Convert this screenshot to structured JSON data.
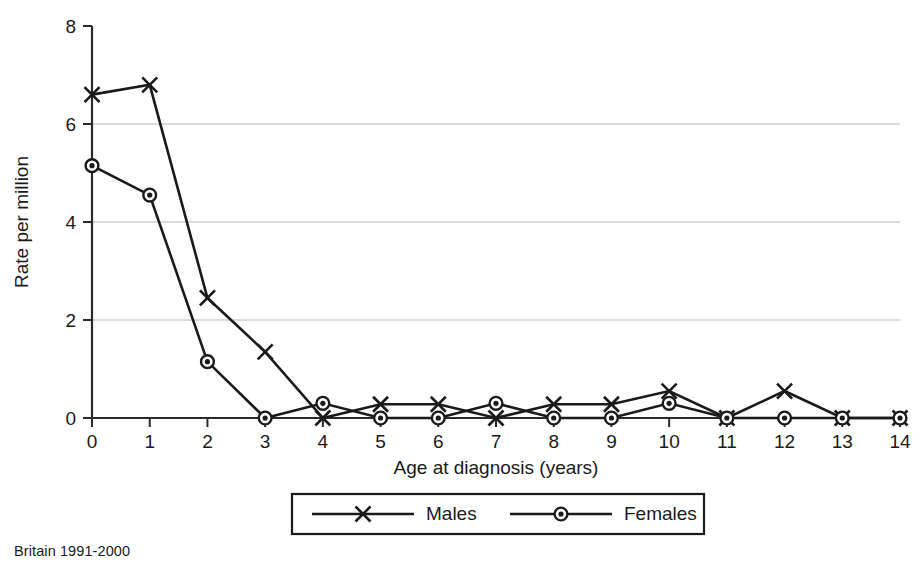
{
  "caption": "Britain 1991-2000",
  "chart_data": {
    "type": "line",
    "title": "",
    "subtitle": "",
    "xlabel": "Age at diagnosis (years)",
    "ylabel": "Rate per million",
    "x": [
      0,
      1,
      2,
      3,
      4,
      5,
      6,
      7,
      8,
      9,
      10,
      11,
      12,
      13,
      14
    ],
    "categories": [
      "0",
      "1",
      "2",
      "3",
      "4",
      "5",
      "6",
      "7",
      "8",
      "9",
      "10",
      "11",
      "12",
      "13",
      "14"
    ],
    "xlim": [
      0,
      14
    ],
    "ylim": [
      0,
      8
    ],
    "x_ticks": [
      "0",
      "1",
      "2",
      "3",
      "4",
      "5",
      "6",
      "7",
      "8",
      "9",
      "10",
      "11",
      "12",
      "13",
      "14"
    ],
    "y_ticks": [
      "0",
      "2",
      "4",
      "6",
      "8"
    ],
    "y_tick_values": [
      0,
      2,
      4,
      6,
      8
    ],
    "grid": "horizontal",
    "gridline_values": [
      2,
      4,
      6
    ],
    "legend_position": "bottom",
    "series": [
      {
        "name": "Males",
        "marker": "x-cross",
        "color": "#1a1a1a",
        "values": [
          6.6,
          6.8,
          2.45,
          1.35,
          0.0,
          0.28,
          0.28,
          0.0,
          0.28,
          0.28,
          0.55,
          0.0,
          0.55,
          0.0,
          0.0
        ]
      },
      {
        "name": "Females",
        "marker": "circle",
        "color": "#1a1a1a",
        "values": [
          5.15,
          4.55,
          1.15,
          0.0,
          0.3,
          0.0,
          0.0,
          0.3,
          0.0,
          0.0,
          0.3,
          0.0,
          0.0,
          0.0,
          0.0
        ]
      }
    ]
  }
}
